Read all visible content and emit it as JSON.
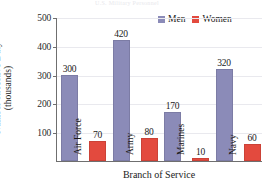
{
  "chart_data": {
    "type": "bar",
    "title": "",
    "xlabel": "Branch of Service",
    "ylabel_line1": "Number on Active Duty",
    "ylabel_line2": "(thousands)",
    "categories": [
      "Air Force",
      "Army",
      "Marines",
      "Navy"
    ],
    "series": [
      {
        "name": "Men",
        "color": "#8b8bb8",
        "values": [
          300,
          420,
          170,
          320
        ]
      },
      {
        "name": "Women",
        "color": "#e34a3e",
        "values": [
          70,
          80,
          10,
          60
        ]
      }
    ],
    "ylim": [
      0,
      500
    ],
    "yticks": [
      500,
      400,
      300,
      200,
      100
    ],
    "ytick_labels": [
      "500",
      "400",
      "300",
      "200",
      "100"
    ],
    "grid": true,
    "legend_position": "top-right",
    "value_labels": {
      "men": [
        "300",
        "420",
        "170",
        "320"
      ],
      "women": [
        "70",
        "80",
        "10",
        "60"
      ]
    }
  },
  "legend": {
    "men_label": "Men",
    "women_label": "Women"
  },
  "axes": {
    "x_title": "Branch of Service",
    "y_title_line1": "Number on Active Duty",
    "y_title_line2": "(thousands)"
  },
  "title_strip": "U.S. Military Personnel"
}
